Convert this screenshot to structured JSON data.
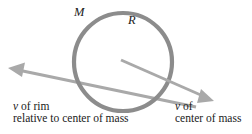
{
  "figure": {
    "background_color": "#ffffff",
    "stroke_color": "#8c8c8c",
    "arrow_color": "#a3a3a3",
    "text_color": "#1a1a1a",
    "width": 252,
    "height": 134
  },
  "hoop": {
    "name": "hoop",
    "center_x": 123,
    "center_y": 62,
    "radius": 49,
    "stroke_width": 4,
    "mass_label": "M",
    "radius_label": "R"
  },
  "arrows": [
    {
      "name": "v-of-rim-arrow",
      "label_line1": "v",
      "label_rest1": " of rim",
      "label_line2": "relative to center of mass",
      "from_x": 196,
      "from_y": 107,
      "to_x": 9,
      "to_y": 68,
      "direction": "up-left"
    },
    {
      "name": "v-of-center-of-mass-arrow",
      "label_line1": "v",
      "label_rest1": " of",
      "label_line2": "center of mass",
      "from_x": 121,
      "from_y": 60,
      "to_x": 213,
      "to_y": 101,
      "direction": "down-right"
    }
  ]
}
